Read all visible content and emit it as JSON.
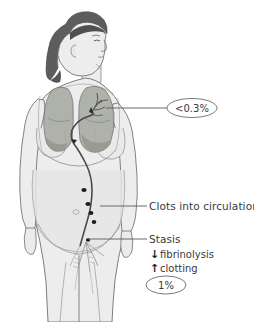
{
  "colors": {
    "background": "#ffffff",
    "skin_fill": "#eeeeee",
    "skin_outline": "#6f6f6f",
    "body_shadow": "#e2e2e2",
    "hair": "#5d5d5d",
    "hair_dark": "#4a4a4a",
    "lung_fill": "#a9aba4",
    "lung_outline": "#6c6e68",
    "rib_line": "#8d8d8d",
    "vessel": "#4a4a4a",
    "clot": "#1c1c1c",
    "leader_line": "#5a5a5a",
    "text": "#3a3a3a",
    "ellipse_stroke": "#6a6a6a"
  },
  "annotations": [
    {
      "id": "pulmonary-embolism",
      "text": "<0.3%",
      "style": "ellipse",
      "target": "left lung vasculature",
      "leader_from_x": 108,
      "leader_to_x": 168,
      "leader_y": 108
    },
    {
      "id": "clots-into-circulation",
      "text": "Clots into circulation",
      "style": "plain",
      "target": "iliac vein clots",
      "leader_from_x": 103,
      "leader_to_x": 148,
      "leader_y": 206
    },
    {
      "id": "stasis",
      "text": "Stasis",
      "style": "plain",
      "target": "pelvic / femoral vein",
      "leader_from_x": 88,
      "leader_to_x": 148,
      "leader_y": 239
    },
    {
      "id": "fibrinolysis",
      "text": "fibrinolysis",
      "style": "arrow",
      "arrow": "down",
      "arrow_glyph": "↓"
    },
    {
      "id": "clotting",
      "text": "clotting",
      "style": "arrow",
      "arrow": "up",
      "arrow_glyph": "↑"
    },
    {
      "id": "dvt-incidence",
      "text": "1%",
      "style": "ellipse",
      "target": "deep vein thrombosis rate"
    }
  ],
  "clot_markers": {
    "count": 4,
    "description": "dark clot dots along the iliac vein"
  }
}
